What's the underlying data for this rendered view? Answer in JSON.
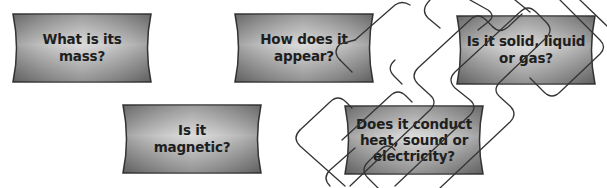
{
  "diagram": {
    "type": "question-boxes",
    "box_fill_light": "#d9d9d9",
    "box_fill_dark": "#8c8c8c",
    "box_border": "#3a3a3a",
    "text_color": "#1e1e1e",
    "boxes": [
      {
        "id": "mass",
        "text": "What is its\nmass?",
        "x": 10,
        "y": 13
      },
      {
        "id": "appearance",
        "text": "How does it\nappear?",
        "x": 232,
        "y": 13
      },
      {
        "id": "state",
        "text": "Is it solid, liquid\nor gas?",
        "x": 454,
        "y": 15
      },
      {
        "id": "magnetic",
        "text": "Is it\nmagnetic?",
        "x": 120,
        "y": 104
      },
      {
        "id": "conduct",
        "text": "Does it conduct\nheat, sound or\nelectricity?",
        "x": 342,
        "y": 105
      }
    ]
  }
}
